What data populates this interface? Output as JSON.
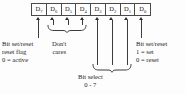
{
  "figure": {
    "register_width_bits": 8,
    "ink_color": "#2a2a2a",
    "line_color": "#3c3c3c",
    "background_color": "#fdfdfd"
  },
  "bits": [
    {
      "name": "D",
      "index": "7"
    },
    {
      "name": "D",
      "index": "6"
    },
    {
      "name": "D",
      "index": "5"
    },
    {
      "name": "D",
      "index": "4"
    },
    {
      "name": "D",
      "index": "3"
    },
    {
      "name": "D",
      "index": "2"
    },
    {
      "name": "D",
      "index": "1"
    },
    {
      "name": "D",
      "index": "0"
    }
  ],
  "annotations": {
    "set_reset_flag": {
      "line1": "Bit set/reset",
      "line2": "reset flag",
      "line3": "0 = active"
    },
    "dont_cares": {
      "line1": "Don't",
      "line2": "cares"
    },
    "set_reset_value": {
      "line1": "Bit set/reset",
      "line2": "1 = set",
      "line3": "0 = reset"
    },
    "bit_select": {
      "line1": "Bit select",
      "line2": "0 - 7"
    }
  }
}
